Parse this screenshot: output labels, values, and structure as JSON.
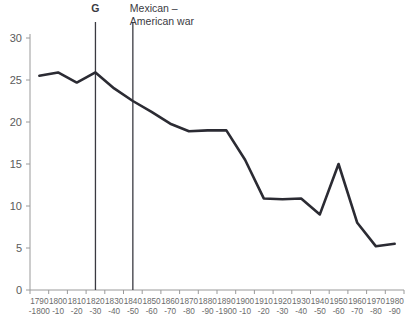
{
  "chart_data": {
    "type": "line",
    "title": "",
    "subtitle": "",
    "xlabel": "",
    "ylabel": "",
    "ylim": [
      0,
      31
    ],
    "yticks": [
      0,
      5,
      10,
      15,
      20,
      25,
      30
    ],
    "grid": false,
    "legend": "none",
    "categories": [
      "1790-1800",
      "1800-10",
      "1810-20",
      "1820-30",
      "1830-40",
      "1840-50",
      "1850-60",
      "1860-70",
      "1870-80",
      "1880-90",
      "1890-1900",
      "1900-10",
      "1910-20",
      "1920-30",
      "1930-40",
      "1940-50",
      "1950-60",
      "1960-70",
      "1970-80",
      "1980-90"
    ],
    "categories_line1": [
      "1790",
      "1800",
      "1810",
      "1820",
      "1830",
      "1840",
      "1850",
      "1860",
      "1870",
      "1880",
      "1890",
      "1900",
      "1910",
      "1920",
      "1930",
      "1940",
      "1950",
      "1960",
      "1970",
      "1980"
    ],
    "categories_line2": [
      "-1800",
      "-10",
      "-20",
      "-30",
      "-40",
      "-50",
      "-60",
      "-70",
      "-80",
      "-90",
      "-1900",
      "-10",
      "-20",
      "-30",
      "-40",
      "-50",
      "-60",
      "-70",
      "-80",
      "-90"
    ],
    "values": [
      25.5,
      25.9,
      24.7,
      25.9,
      24.0,
      22.5,
      21.2,
      19.8,
      18.9,
      19.0,
      19.0,
      15.5,
      10.9,
      10.8,
      10.9,
      9.0,
      15.0,
      8.0,
      5.2,
      5.5
    ],
    "series": [
      {
        "name": "value",
        "values": [
          25.5,
          25.9,
          24.7,
          25.9,
          24.0,
          22.5,
          21.2,
          19.8,
          18.9,
          19.0,
          19.0,
          15.5,
          10.9,
          10.8,
          10.9,
          9.0,
          15.0,
          8.0,
          5.2,
          5.5
        ],
        "color": "#2b2b33"
      }
    ],
    "annotations": [
      {
        "label": "G",
        "category": "1820-30",
        "bold": true,
        "lines": [
          "G"
        ]
      },
      {
        "label": "Mexican – American war",
        "category": "1840-50",
        "bold": false,
        "lines": [
          "Mexican –",
          "American war"
        ]
      }
    ],
    "colors": {
      "line": "#2b2b33",
      "axis": "#9a9a9a",
      "tick_label": "#5b5b5b",
      "x_tick_label": "#6b6b6b",
      "annotation": "#3a3a42",
      "background": "#ffffff"
    }
  }
}
